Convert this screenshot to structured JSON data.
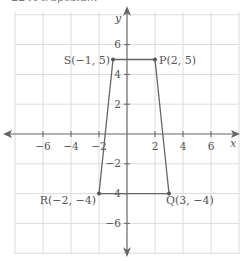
{
  "caption": "22  A trapezium",
  "axes": {
    "x_label": "x",
    "y_label": "y",
    "x_ticks": [
      "−6",
      "−4",
      "−2",
      "2",
      "4",
      "6"
    ],
    "y_ticks": [
      "6",
      "4",
      "2",
      "−2",
      "−4",
      "−6"
    ]
  },
  "points": {
    "P": {
      "label": "P(2, 5)",
      "x": 2,
      "y": 5
    },
    "Q": {
      "label": "Q(3, −4)",
      "x": 3,
      "y": -4
    },
    "R": {
      "label": "R(−2, −4)",
      "x": -2,
      "y": -4
    },
    "S": {
      "label": "S(−1, 5)",
      "x": -1,
      "y": 5
    }
  },
  "colors": {
    "grid": "#dcdcdc",
    "axis": "#666666",
    "shape": "#666666",
    "text": "#555555"
  }
}
